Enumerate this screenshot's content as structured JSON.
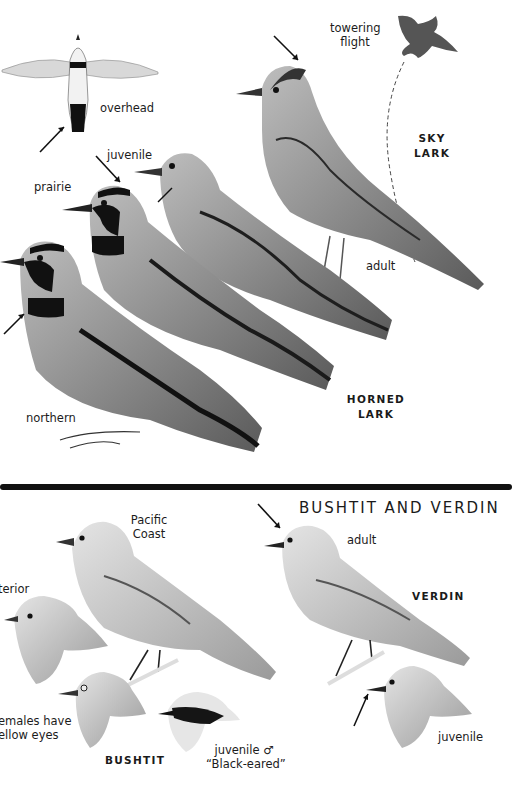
{
  "page": {
    "upper_section": {
      "species": [
        {
          "name": "SKY LARK",
          "labels": [
            "towering flight",
            "adult"
          ]
        },
        {
          "name": "HORNED LARK",
          "labels": [
            "overhead",
            "prairie",
            "juvenile",
            "northern"
          ]
        }
      ],
      "labels": {
        "overhead": "overhead",
        "towering_line1": "towering",
        "towering_line2": "flight",
        "sky_lark": "SKY LARK",
        "juvenile": "juvenile",
        "prairie": "prairie",
        "adult": "adult",
        "northern": "northern",
        "horned_line1": "HORNED",
        "horned_line2": "LARK"
      }
    },
    "lower_section": {
      "title": "BUSHTIT AND VERDIN",
      "labels": {
        "pacific_line1": "Pacific",
        "pacific_line2": "Coast",
        "interior": "terior",
        "females_line1": "emales have",
        "females_line2": "ellow eyes",
        "bushtit": "BUSHTIT",
        "juv_male_line1": "juvenile ♂",
        "juv_male_line2": "“Black-eared”",
        "adult": "adult",
        "verdin": "VERDIN",
        "juvenile": "juvenile"
      }
    },
    "colors": {
      "background": "#ffffff",
      "ink": "#1a1a1a",
      "divider": "#111111"
    }
  }
}
